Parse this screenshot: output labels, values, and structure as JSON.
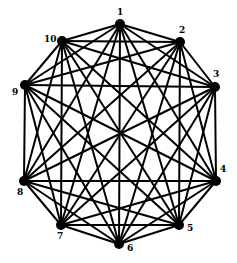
{
  "diagram": {
    "type": "complete-graph",
    "name": "K10",
    "style": {
      "edge_color": "#000000",
      "node_color": "#000000",
      "background": "#ffffff",
      "node_radius": 5,
      "edge_width": 2
    },
    "nodes": [
      {
        "id": "1",
        "label": "1",
        "x": 120,
        "y": 24,
        "lx": 117,
        "ly": 15
      },
      {
        "id": "2",
        "label": "2",
        "x": 180,
        "y": 42,
        "lx": 179,
        "ly": 33
      },
      {
        "id": "3",
        "label": "3",
        "x": 215,
        "y": 87,
        "lx": 213,
        "ly": 77
      },
      {
        "id": "4",
        "label": "4",
        "x": 216,
        "y": 181,
        "lx": 220,
        "ly": 172
      },
      {
        "id": "5",
        "label": "5",
        "x": 179,
        "y": 225,
        "lx": 187,
        "ly": 231
      },
      {
        "id": "6",
        "label": "6",
        "x": 119,
        "y": 244,
        "lx": 127,
        "ly": 251
      },
      {
        "id": "7",
        "label": "7",
        "x": 61,
        "y": 225,
        "lx": 57,
        "ly": 239
      },
      {
        "id": "8",
        "label": "8",
        "x": 24,
        "y": 181,
        "lx": 17,
        "ly": 195
      },
      {
        "id": "9",
        "label": "9",
        "x": 25,
        "y": 85,
        "lx": 12,
        "ly": 95
      },
      {
        "id": "10",
        "label": "10",
        "x": 62,
        "y": 41,
        "lx": 44,
        "ly": 42
      }
    ],
    "edges": "all pairs (complete graph on 10 vertices, 45 edges)"
  }
}
